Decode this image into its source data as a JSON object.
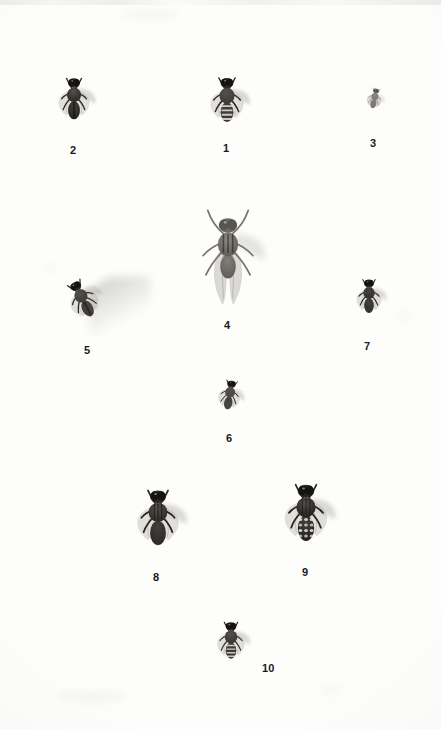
{
  "plate": {
    "kind": "entomological-specimen-plate",
    "background_color": "#fdfdfc",
    "label_color": "#1a1a1a",
    "width": 441,
    "height": 729,
    "specimen_count": 10
  },
  "specimens": [
    {
      "number": "1",
      "label": "1",
      "icon": "fly-dorsal-icon",
      "description": "banded-abdomen hoverfly, wings spread, blurred right wing shadow",
      "body_color": "#3b3835",
      "size_px": 58,
      "center": {
        "x": 227,
        "y": 106
      },
      "label_pos": {
        "x": 223,
        "y": 143
      },
      "rotation_deg": 0,
      "pattern": "bands"
    },
    {
      "number": "2",
      "label": "2",
      "icon": "fly-dorsal-icon",
      "description": "dark stout fly, broad thorax, pale wings, faint motion blur at right",
      "body_color": "#262422",
      "size_px": 54,
      "center": {
        "x": 74,
        "y": 104
      },
      "label_pos": {
        "x": 70,
        "y": 145
      },
      "rotation_deg": 0,
      "pattern": "dark"
    },
    {
      "number": "3",
      "label": "3",
      "icon": "fly-dorsal-icon",
      "description": "smallest specimen, pale grey, tilted",
      "body_color": "#78746e",
      "size_px": 26,
      "center": {
        "x": 374,
        "y": 101
      },
      "label_pos": {
        "x": 370,
        "y": 138
      },
      "rotation_deg": 12,
      "pattern": "pale"
    },
    {
      "number": "4",
      "label": "4",
      "icon": "fly-dorsal-icon",
      "description": "largest specimen, pale grey, forelegs raised high, long wings held close",
      "body_color": "#5e5a55",
      "size_px": 92,
      "center": {
        "x": 228,
        "y": 258
      },
      "label_pos": {
        "x": 224,
        "y": 320
      },
      "rotation_deg": 0,
      "pattern": "pale-large"
    },
    {
      "number": "5",
      "label": "5",
      "icon": "fly-dorsal-icon",
      "description": "fly rotated anticlockwise with long diagonal wing-motion blur to upper right",
      "body_color": "#3a3733",
      "size_px": 50,
      "center": {
        "x": 85,
        "y": 303
      },
      "label_pos": {
        "x": 84,
        "y": 345
      },
      "rotation_deg": -28,
      "pattern": "dark"
    },
    {
      "number": "6",
      "label": "6",
      "icon": "fly-dorsal-icon",
      "description": "small mid-grey fly, slight tilt, soft shadow",
      "body_color": "#4a4742",
      "size_px": 38,
      "center": {
        "x": 229,
        "y": 399
      },
      "label_pos": {
        "x": 226,
        "y": 433
      },
      "rotation_deg": 10,
      "pattern": "mid"
    },
    {
      "number": "7",
      "label": "7",
      "icon": "fly-dorsal-icon",
      "description": "dark compact fly with striped thorax",
      "body_color": "#332f2c",
      "size_px": 44,
      "center": {
        "x": 369,
        "y": 301
      },
      "label_pos": {
        "x": 364,
        "y": 341
      },
      "rotation_deg": 0,
      "pattern": "stripes"
    },
    {
      "number": "8",
      "label": "8",
      "icon": "fly-dorsal-icon",
      "description": "large dark housefly, one wing lifted, strong blurred shadow to the right",
      "body_color": "#2b2826",
      "size_px": 72,
      "center": {
        "x": 158,
        "y": 525
      },
      "label_pos": {
        "x": 153,
        "y": 572
      },
      "rotation_deg": 0,
      "pattern": "stripes"
    },
    {
      "number": "9",
      "label": "9",
      "icon": "fly-dorsal-icon",
      "description": "flesh fly, checkered spotted abdomen, striped thorax, long dark legs",
      "body_color": "#201e1c",
      "size_px": 74,
      "center": {
        "x": 306,
        "y": 520
      },
      "label_pos": {
        "x": 302,
        "y": 567
      },
      "rotation_deg": 0,
      "pattern": "checkered"
    },
    {
      "number": "10",
      "label": "10",
      "icon": "fly-dorsal-icon",
      "description": "mid-size dark fly with banded abdomen, label placed to its right",
      "body_color": "#35322e",
      "size_px": 48,
      "center": {
        "x": 231,
        "y": 645
      },
      "label_pos": {
        "x": 262,
        "y": 663
      },
      "rotation_deg": 0,
      "pattern": "bands"
    }
  ],
  "smudges": [
    {
      "x": 150,
      "y": 14,
      "w": 60,
      "h": 7
    },
    {
      "x": 92,
      "y": 696,
      "w": 70,
      "h": 9
    },
    {
      "x": 330,
      "y": 690,
      "w": 24,
      "h": 6
    },
    {
      "x": 404,
      "y": 316,
      "w": 20,
      "h": 6
    },
    {
      "x": 50,
      "y": 268,
      "w": 16,
      "h": 5
    }
  ]
}
